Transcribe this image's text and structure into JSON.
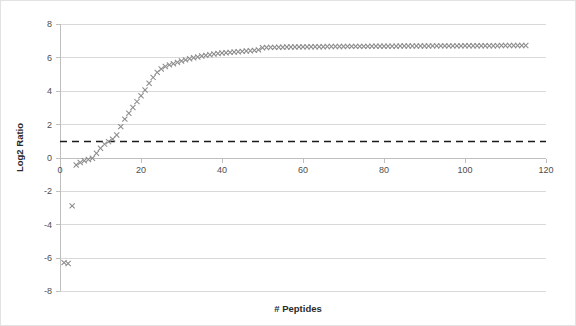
{
  "chart_data": {
    "type": "scatter",
    "title": "",
    "xlabel": "# Peptides",
    "ylabel": "Log2 Ratio",
    "xlim": [
      0,
      120
    ],
    "ylim": [
      -8,
      8
    ],
    "xticks": [
      0,
      20,
      40,
      60,
      80,
      100,
      120
    ],
    "yticks": [
      -8,
      -6,
      -4,
      -2,
      0,
      2,
      4,
      6,
      8
    ],
    "xtick_labels": [
      "0",
      "20",
      "40",
      "60",
      "80",
      "100",
      "120"
    ],
    "ytick_labels": [
      "-8",
      "-6",
      "-4",
      "-2",
      "0",
      "2",
      "4",
      "6",
      "8"
    ],
    "grid": "horizontal",
    "legend": "none",
    "marker": "x-cross",
    "marker_color": "#8c8c8c",
    "annotations": [
      {
        "type": "hline",
        "label": "threshold",
        "y": 1.0,
        "style": "dashed",
        "color": "#1a1a1a"
      }
    ],
    "series": [
      {
        "name": "Log2 Ratio vs # Peptides",
        "points": [
          [
            1,
            -6.3
          ],
          [
            2,
            -6.35
          ],
          [
            3,
            -2.9
          ],
          [
            4,
            -0.45
          ],
          [
            5,
            -0.3
          ],
          [
            6,
            -0.2
          ],
          [
            7,
            -0.12
          ],
          [
            8,
            -0.05
          ],
          [
            9,
            0.25
          ],
          [
            10,
            0.55
          ],
          [
            11,
            0.8
          ],
          [
            12,
            0.95
          ],
          [
            13,
            1.1
          ],
          [
            14,
            1.35
          ],
          [
            15,
            1.85
          ],
          [
            16,
            2.3
          ],
          [
            17,
            2.65
          ],
          [
            18,
            3.0
          ],
          [
            19,
            3.35
          ],
          [
            20,
            3.7
          ],
          [
            21,
            4.05
          ],
          [
            22,
            4.45
          ],
          [
            23,
            4.8
          ],
          [
            24,
            5.1
          ],
          [
            25,
            5.3
          ],
          [
            26,
            5.45
          ],
          [
            27,
            5.55
          ],
          [
            28,
            5.62
          ],
          [
            29,
            5.7
          ],
          [
            30,
            5.78
          ],
          [
            31,
            5.85
          ],
          [
            32,
            5.92
          ],
          [
            33,
            5.98
          ],
          [
            34,
            6.02
          ],
          [
            35,
            6.08
          ],
          [
            36,
            6.12
          ],
          [
            37,
            6.16
          ],
          [
            38,
            6.2
          ],
          [
            39,
            6.23
          ],
          [
            40,
            6.26
          ],
          [
            41,
            6.28
          ],
          [
            42,
            6.3
          ],
          [
            43,
            6.32
          ],
          [
            44,
            6.34
          ],
          [
            45,
            6.36
          ],
          [
            46,
            6.38
          ],
          [
            47,
            6.4
          ],
          [
            48,
            6.42
          ],
          [
            49,
            6.45
          ],
          [
            50,
            6.58
          ],
          [
            51,
            6.59
          ],
          [
            52,
            6.6
          ],
          [
            53,
            6.6
          ],
          [
            54,
            6.61
          ],
          [
            55,
            6.61
          ],
          [
            56,
            6.62
          ],
          [
            57,
            6.62
          ],
          [
            58,
            6.62
          ],
          [
            59,
            6.63
          ],
          [
            60,
            6.63
          ],
          [
            61,
            6.63
          ],
          [
            62,
            6.64
          ],
          [
            63,
            6.64
          ],
          [
            64,
            6.64
          ],
          [
            65,
            6.64
          ],
          [
            66,
            6.65
          ],
          [
            67,
            6.65
          ],
          [
            68,
            6.65
          ],
          [
            69,
            6.65
          ],
          [
            70,
            6.65
          ],
          [
            71,
            6.66
          ],
          [
            72,
            6.66
          ],
          [
            73,
            6.66
          ],
          [
            74,
            6.66
          ],
          [
            75,
            6.66
          ],
          [
            76,
            6.66
          ],
          [
            77,
            6.67
          ],
          [
            78,
            6.67
          ],
          [
            79,
            6.67
          ],
          [
            80,
            6.67
          ],
          [
            81,
            6.67
          ],
          [
            82,
            6.67
          ],
          [
            83,
            6.67
          ],
          [
            84,
            6.68
          ],
          [
            85,
            6.68
          ],
          [
            86,
            6.68
          ],
          [
            87,
            6.68
          ],
          [
            88,
            6.68
          ],
          [
            89,
            6.68
          ],
          [
            90,
            6.68
          ],
          [
            91,
            6.68
          ],
          [
            92,
            6.69
          ],
          [
            93,
            6.69
          ],
          [
            94,
            6.69
          ],
          [
            95,
            6.69
          ],
          [
            96,
            6.69
          ],
          [
            97,
            6.69
          ],
          [
            98,
            6.69
          ],
          [
            99,
            6.69
          ],
          [
            100,
            6.7
          ],
          [
            101,
            6.7
          ],
          [
            102,
            6.7
          ],
          [
            103,
            6.7
          ],
          [
            104,
            6.7
          ],
          [
            105,
            6.7
          ],
          [
            106,
            6.7
          ],
          [
            107,
            6.7
          ],
          [
            108,
            6.7
          ],
          [
            109,
            6.71
          ],
          [
            110,
            6.71
          ],
          [
            111,
            6.71
          ],
          [
            112,
            6.71
          ],
          [
            113,
            6.71
          ],
          [
            114,
            6.71
          ],
          [
            115,
            6.71
          ]
        ]
      }
    ]
  }
}
